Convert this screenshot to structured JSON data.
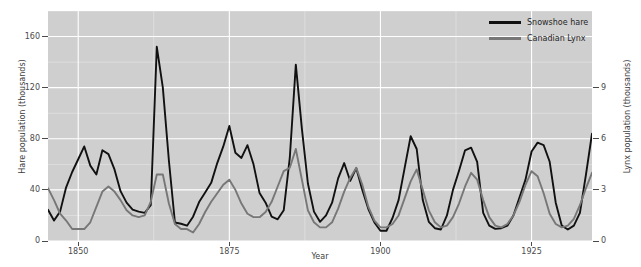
{
  "chart_data": {
    "type": "line",
    "title": "",
    "subtitle": "",
    "xlabel": "Year",
    "ylabel": "Hare population (thousands)",
    "ylabel_right": "Lynx population (thousands)",
    "grid": true,
    "legend_position": "top-right",
    "panel_background": "#cfcfcf",
    "grid_color": "#ffffff",
    "figure_background": "#ffffff",
    "xlim": [
      1845,
      1935
    ],
    "ylim": [
      0,
      180
    ],
    "ylim_right": [
      0,
      13.5
    ],
    "xticks": [
      1850,
      1875,
      1900,
      1925
    ],
    "xtick_labels": [
      "1850",
      "1875",
      "1900",
      "1925"
    ],
    "yticks": [
      0,
      40,
      80,
      120,
      160
    ],
    "ytick_labels": [
      "0",
      "40",
      "80",
      "120",
      "160"
    ],
    "yticks_right": [
      0,
      3,
      6,
      9
    ],
    "ytick_labels_right": [
      "0",
      "3",
      "6",
      "9"
    ],
    "x": [
      1845,
      1846,
      1847,
      1848,
      1849,
      1850,
      1851,
      1852,
      1853,
      1854,
      1855,
      1856,
      1857,
      1858,
      1859,
      1860,
      1861,
      1862,
      1863,
      1864,
      1865,
      1866,
      1867,
      1868,
      1869,
      1870,
      1871,
      1872,
      1873,
      1874,
      1875,
      1876,
      1877,
      1878,
      1879,
      1880,
      1881,
      1882,
      1883,
      1884,
      1885,
      1886,
      1887,
      1888,
      1889,
      1890,
      1891,
      1892,
      1893,
      1894,
      1895,
      1896,
      1897,
      1898,
      1899,
      1900,
      1901,
      1902,
      1903,
      1904,
      1905,
      1906,
      1907,
      1908,
      1909,
      1910,
      1911,
      1912,
      1913,
      1914,
      1915,
      1916,
      1917,
      1918,
      1919,
      1920,
      1921,
      1922,
      1923,
      1924,
      1925,
      1926,
      1927,
      1928,
      1929,
      1930,
      1931,
      1932,
      1933,
      1934,
      1935
    ],
    "series": [
      {
        "name": "Snowshoe hare",
        "color": "#111111",
        "axis": "left",
        "unit": "thousands",
        "values": [
          24.5,
          16.0,
          23.0,
          42.0,
          54.0,
          64.0,
          74.0,
          59.0,
          52.0,
          71.0,
          68.0,
          56.0,
          39.0,
          30.0,
          24.5,
          23.0,
          22.0,
          28.0,
          152.0,
          120.0,
          63.0,
          14.5,
          13.5,
          12.0,
          19.0,
          30.5,
          38.0,
          45.5,
          61.0,
          74.0,
          90.0,
          69.0,
          65.0,
          75.0,
          60.0,
          37.5,
          30.0,
          19.0,
          17.0,
          24.0,
          65.0,
          138.0,
          88.0,
          45.0,
          23.0,
          15.0,
          20.0,
          30.0,
          49.0,
          61.0,
          47.0,
          57.0,
          40.0,
          25.0,
          14.5,
          8.0,
          8.0,
          18.0,
          32.0,
          57.0,
          82.0,
          72.0,
          32.0,
          15.0,
          10.0,
          9.0,
          20.0,
          40.0,
          55.0,
          71.0,
          73.0,
          62.0,
          22.0,
          12.0,
          9.5,
          10.0,
          12.0,
          20.0,
          34.0,
          48.0,
          70.0,
          77.0,
          75.0,
          62.0,
          30.0,
          12.0,
          9.0,
          12.0,
          22.0,
          52.0,
          84.0
        ]
      },
      {
        "name": "Canadian Lynx",
        "color": "#777777",
        "axis": "right",
        "unit": "thousands",
        "values": [
          3.1,
          2.4,
          1.6,
          1.2,
          0.7,
          0.7,
          0.7,
          1.1,
          2.0,
          2.9,
          3.2,
          2.9,
          2.4,
          1.8,
          1.5,
          1.4,
          1.5,
          2.3,
          3.9,
          3.9,
          2.2,
          1.0,
          0.7,
          0.7,
          0.5,
          1.0,
          1.7,
          2.3,
          2.8,
          3.3,
          3.6,
          3.0,
          2.2,
          1.6,
          1.4,
          1.4,
          1.7,
          2.3,
          3.2,
          4.1,
          4.3,
          5.4,
          3.6,
          1.8,
          1.1,
          0.8,
          0.8,
          1.1,
          1.9,
          2.9,
          3.7,
          4.3,
          3.3,
          2.0,
          1.2,
          0.8,
          0.8,
          1.0,
          1.5,
          2.5,
          3.5,
          4.2,
          3.0,
          1.8,
          1.1,
          0.8,
          0.9,
          1.4,
          2.2,
          3.2,
          4.0,
          3.6,
          2.4,
          1.4,
          0.9,
          0.8,
          1.0,
          1.5,
          2.3,
          3.3,
          4.1,
          3.8,
          2.8,
          1.6,
          1.0,
          0.8,
          0.9,
          1.3,
          2.1,
          3.1,
          4.0
        ]
      }
    ]
  },
  "legend": {
    "items": [
      {
        "label": "Snowshoe hare",
        "color": "#111111"
      },
      {
        "label": "Canadian Lynx",
        "color": "#777777"
      }
    ]
  }
}
